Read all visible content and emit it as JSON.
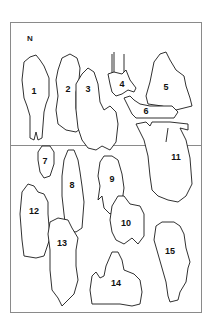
{
  "diagram": {
    "north_label": "N",
    "frame": {
      "x": 10,
      "y": 22,
      "width": 191,
      "height": 123
    },
    "shapes": [
      {
        "id": "1",
        "label": "1"
      },
      {
        "id": "2",
        "label": "2"
      },
      {
        "id": "3",
        "label": "3"
      },
      {
        "id": "4",
        "label": "4"
      },
      {
        "id": "5",
        "label": "5"
      },
      {
        "id": "6",
        "label": "6"
      },
      {
        "id": "7",
        "label": "7"
      },
      {
        "id": "8",
        "label": "8"
      },
      {
        "id": "9",
        "label": "9"
      },
      {
        "id": "10",
        "label": "10"
      },
      {
        "id": "11",
        "label": "11"
      },
      {
        "id": "12",
        "label": "12"
      },
      {
        "id": "13",
        "label": "13"
      },
      {
        "id": "14",
        "label": "14"
      },
      {
        "id": "15",
        "label": "15"
      }
    ]
  }
}
